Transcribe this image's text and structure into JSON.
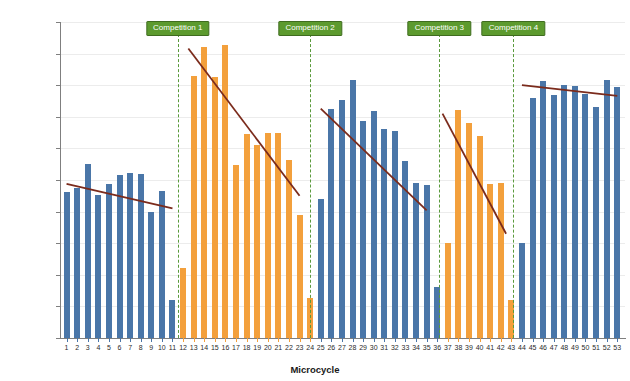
{
  "chart_data": {
    "type": "bar",
    "title": "",
    "xlabel": "Microcycle",
    "ylabel": "Volume load (kg)",
    "ylim": [
      0,
      50000
    ],
    "ytick_labels": [
      "0",
      "5,000",
      "10,000",
      "15,000",
      "20,000",
      "25,000",
      "30,000",
      "35,000",
      "40,000",
      "45,000",
      "50,000"
    ],
    "ytick_values": [
      0,
      5000,
      10000,
      15000,
      20000,
      25000,
      30000,
      35000,
      40000,
      45000,
      50000
    ],
    "grid": true,
    "legend_position": "none",
    "colors": {
      "blue_bar": "#4a76a8",
      "orange_bar": "#f3a03c",
      "trendline": "#7b2b1c",
      "competition_marker": "#5c9a2e",
      "competition_marker_border": "#3f6c1f",
      "gridline": "#ececec",
      "axis": "#7f7f7f"
    },
    "categories": [
      1,
      2,
      3,
      4,
      5,
      6,
      7,
      8,
      9,
      10,
      11,
      12,
      13,
      14,
      15,
      16,
      17,
      18,
      19,
      20,
      21,
      22,
      23,
      24,
      25,
      26,
      27,
      28,
      29,
      30,
      31,
      32,
      33,
      34,
      35,
      36,
      37,
      38,
      39,
      40,
      41,
      42,
      43,
      44,
      45,
      46,
      47,
      48,
      49,
      50,
      51,
      52,
      53
    ],
    "values": [
      23100,
      23700,
      27500,
      22600,
      24300,
      25800,
      26100,
      25900,
      19900,
      23300,
      6000,
      11000,
      41400,
      46100,
      41300,
      46300,
      27400,
      32300,
      30500,
      32400,
      32400,
      28200,
      19500,
      6400,
      22000,
      36200,
      37600,
      40800,
      34400,
      35900,
      33000,
      32700,
      28000,
      24500,
      24200,
      8000,
      15000,
      36000,
      34000,
      32000,
      24400,
      24500,
      6000,
      15000,
      38000,
      40700,
      38400,
      40000,
      39900,
      38600,
      36500,
      40800,
      39700
    ],
    "bar_colors": [
      "blue",
      "blue",
      "blue",
      "blue",
      "blue",
      "blue",
      "blue",
      "blue",
      "blue",
      "blue",
      "blue",
      "orange",
      "orange",
      "orange",
      "orange",
      "orange",
      "orange",
      "orange",
      "orange",
      "orange",
      "orange",
      "orange",
      "orange",
      "orange",
      "blue",
      "blue",
      "blue",
      "blue",
      "blue",
      "blue",
      "blue",
      "blue",
      "blue",
      "blue",
      "blue",
      "blue",
      "orange",
      "orange",
      "orange",
      "orange",
      "orange",
      "orange",
      "orange",
      "blue",
      "blue",
      "blue",
      "blue",
      "blue",
      "blue",
      "blue",
      "blue",
      "blue",
      "blue"
    ],
    "competitions": [
      {
        "label": "Competition 1",
        "at_microcycle": 11.5
      },
      {
        "label": "Competition 2",
        "at_microcycle": 24.0
      },
      {
        "label": "Competition 3",
        "at_microcycle": 36.2
      },
      {
        "label": "Competition 4",
        "at_microcycle": 43.2
      }
    ],
    "trendlines": [
      {
        "phase": "preparation-1",
        "x_start": 1,
        "x_end": 11,
        "y_start": 24400,
        "y_end": 20500
      },
      {
        "phase": "competition-1",
        "x_start": 12.5,
        "x_end": 23,
        "y_start": 45800,
        "y_end": 22500
      },
      {
        "phase": "competition-2",
        "x_start": 25,
        "x_end": 35,
        "y_start": 36300,
        "y_end": 20200
      },
      {
        "phase": "competition-3",
        "x_start": 36.5,
        "x_end": 42.5,
        "y_start": 35500,
        "y_end": 16500
      },
      {
        "phase": "competition-4",
        "x_start": 44,
        "x_end": 53,
        "y_start": 40000,
        "y_end": 38300
      }
    ]
  }
}
